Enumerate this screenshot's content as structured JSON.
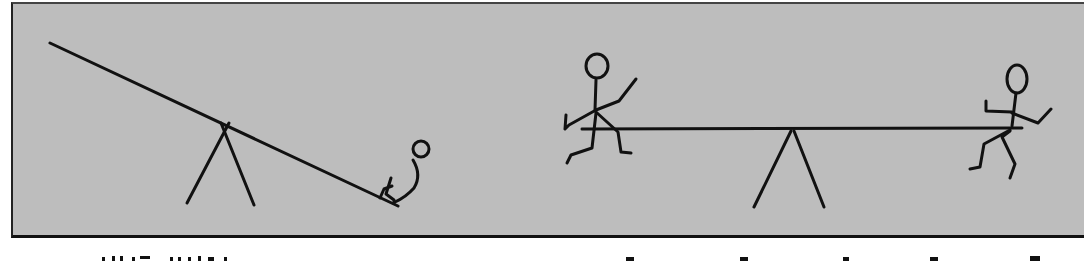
{
  "figure": {
    "background_color": "#bdbdbd",
    "line_color": "#111111",
    "panels": [
      {
        "id": "left",
        "description": "Tilted seesaw with one small seated figure at the lowered right end",
        "figures": [
          "seated-child"
        ]
      },
      {
        "id": "right",
        "description": "Level seesaw with two stick figures balanced at each end",
        "figures": [
          "stick-figure-left",
          "stick-figure-right"
        ]
      }
    ]
  },
  "captions": {
    "left": "",
    "right": "",
    "note": "caption text cut off at image bottom edge (illegible)"
  }
}
